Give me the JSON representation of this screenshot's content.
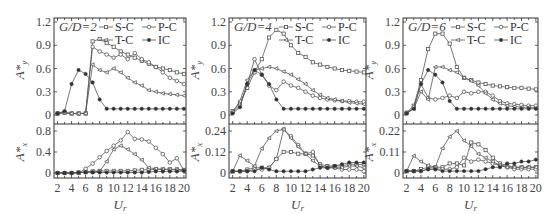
{
  "figure": {
    "panels": [
      {
        "label": "G/D=2",
        "gd_prefix": "G/D",
        "gd_value": "2"
      },
      {
        "label": "G/D=4",
        "gd_prefix": "G/D",
        "gd_value": "4"
      },
      {
        "label": "G/D=6",
        "gd_prefix": "G/D",
        "gd_value": "6"
      }
    ],
    "xlabel": "Ur",
    "legend": [
      "S-C",
      "P-C",
      "T-C",
      "IC"
    ]
  },
  "chart_data": [
    {
      "type": "line",
      "title": "G/D=2 (A*y)",
      "xlabel": "Ur",
      "ylabel": "A*y",
      "x": [
        2,
        3,
        4,
        5,
        6,
        7,
        8,
        9,
        10,
        11,
        12,
        13,
        14,
        15,
        16,
        17,
        18,
        19,
        20
      ],
      "ylim": [
        0,
        1.2
      ],
      "yticks": [
        0,
        0.3,
        0.6,
        0.9,
        1.2
      ],
      "series": [
        {
          "name": "S-C",
          "marker": "square",
          "values": [
            0.02,
            0.03,
            0.02,
            0.02,
            0.02,
            0.95,
            0.98,
            0.93,
            0.88,
            0.82,
            0.78,
            0.74,
            0.7,
            0.66,
            0.62,
            0.6,
            0.58,
            0.55,
            0.53
          ]
        },
        {
          "name": "P-C",
          "marker": "circle",
          "values": [
            0.02,
            0.03,
            0.02,
            0.02,
            0.02,
            0.88,
            0.82,
            0.78,
            0.74,
            0.78,
            0.72,
            0.8,
            0.72,
            0.68,
            0.62,
            0.55,
            0.48,
            0.44,
            0.4
          ]
        },
        {
          "name": "T-C",
          "marker": "triangle",
          "values": [
            0.02,
            0.03,
            0.02,
            0.02,
            0.02,
            0.65,
            0.58,
            0.55,
            0.6,
            0.55,
            0.48,
            0.42,
            0.38,
            0.32,
            0.3,
            0.28,
            0.27,
            0.26,
            0.25
          ]
        },
        {
          "name": "IC",
          "marker": "filled-circle",
          "values": [
            0.02,
            0.05,
            0.4,
            0.58,
            0.53,
            0.42,
            0.2,
            0.08,
            0.08,
            0.08,
            0.08,
            0.08,
            0.08,
            0.08,
            0.08,
            0.08,
            0.08,
            0.08,
            0.08
          ]
        }
      ]
    },
    {
      "type": "line",
      "title": "G/D=2 (A*x)",
      "xlabel": "Ur",
      "ylabel": "A*x",
      "x": [
        2,
        3,
        4,
        5,
        6,
        7,
        8,
        9,
        10,
        11,
        12,
        13,
        14,
        15,
        16,
        17,
        18,
        19,
        20
      ],
      "ylim": [
        0,
        0.8
      ],
      "yticks": [
        0,
        0.4,
        0.8
      ],
      "series": [
        {
          "name": "S-C",
          "marker": "square",
          "values": [
            0,
            0,
            0,
            0.01,
            0.02,
            0.03,
            0.04,
            0.04,
            0.04,
            0.04,
            0.04,
            0.05,
            0.06,
            0.06,
            0.07,
            0.07,
            0.07,
            0.07,
            0.06
          ]
        },
        {
          "name": "P-C",
          "marker": "circle",
          "values": [
            0,
            0,
            0,
            0,
            0.08,
            0.18,
            0.3,
            0.42,
            0.52,
            0.62,
            0.78,
            0.65,
            0.64,
            0.6,
            0.48,
            0.36,
            0.2,
            0.28,
            0.05
          ]
        },
        {
          "name": "T-C",
          "marker": "triangle",
          "values": [
            0,
            0,
            0,
            0,
            0.02,
            0.03,
            0.03,
            0.22,
            0.45,
            0.52,
            0.45,
            0.36,
            0.25,
            0.1,
            0.08,
            0.07,
            0.07,
            0.06,
            0.05
          ]
        },
        {
          "name": "IC",
          "marker": "filled-circle",
          "values": [
            0,
            0,
            0,
            0.01,
            0.01,
            0.01,
            0.01,
            0.01,
            0.01,
            0.01,
            0.01,
            0.01,
            0.01,
            0.02,
            0.03,
            0.03,
            0.03,
            0.03,
            0.04
          ]
        }
      ]
    },
    {
      "type": "line",
      "title": "G/D=4 (A*y)",
      "xlabel": "Ur",
      "ylabel": "A*y",
      "x": [
        2,
        3,
        4,
        5,
        6,
        7,
        8,
        9,
        10,
        11,
        12,
        13,
        14,
        15,
        16,
        17,
        18,
        19,
        20
      ],
      "ylim": [
        0,
        1.2
      ],
      "yticks": [
        0,
        0.3,
        0.6,
        0.9,
        1.2
      ],
      "series": [
        {
          "name": "S-C",
          "marker": "square",
          "values": [
            0.05,
            0.15,
            0.35,
            0.55,
            0.72,
            1.0,
            1.1,
            1.05,
            0.9,
            0.8,
            0.75,
            0.68,
            0.65,
            0.62,
            0.6,
            0.58,
            0.57,
            0.56,
            0.55
          ]
        },
        {
          "name": "P-C",
          "marker": "circle",
          "values": [
            0.03,
            0.12,
            0.4,
            0.72,
            0.52,
            0.38,
            0.32,
            0.43,
            0.38,
            0.35,
            0.3,
            0.25,
            0.22,
            0.2,
            0.19,
            0.18,
            0.18,
            0.17,
            0.17
          ]
        },
        {
          "name": "T-C",
          "marker": "triangle",
          "values": [
            0.04,
            0.18,
            0.45,
            0.58,
            0.6,
            0.62,
            0.6,
            0.56,
            0.52,
            0.46,
            0.4,
            0.32,
            0.26,
            0.22,
            0.2,
            0.18,
            0.16,
            0.15,
            0.14
          ]
        },
        {
          "name": "IC",
          "marker": "filled-circle",
          "values": [
            0.02,
            0.1,
            0.4,
            0.58,
            0.52,
            0.4,
            0.2,
            0.08,
            0.08,
            0.08,
            0.08,
            0.08,
            0.08,
            0.08,
            0.08,
            0.08,
            0.08,
            0.08,
            0.08
          ]
        }
      ]
    },
    {
      "type": "line",
      "title": "G/D=4 (A*x)",
      "xlabel": "Ur",
      "ylabel": "A*x",
      "x": [
        2,
        3,
        4,
        5,
        6,
        7,
        8,
        9,
        10,
        11,
        12,
        13,
        14,
        15,
        16,
        17,
        18,
        19,
        20
      ],
      "ylim": [
        0,
        0.24
      ],
      "yticks": [
        0,
        0.12,
        0.24
      ],
      "series": [
        {
          "name": "S-C",
          "marker": "square",
          "values": [
            0.01,
            0.01,
            0.02,
            0.03,
            0.03,
            0.03,
            0.08,
            0.12,
            0.12,
            0.11,
            0.11,
            0.1,
            0.05,
            0.04,
            0.04,
            0.04,
            0.05,
            0.05,
            0.05
          ]
        },
        {
          "name": "P-C",
          "marker": "circle",
          "values": [
            0.01,
            0.01,
            0.01,
            0.02,
            0.02,
            0.03,
            0.08,
            0.25,
            0.21,
            0.16,
            0.11,
            0.12,
            0.04,
            0.03,
            0.03,
            0.02,
            0.02,
            0.02,
            0.01
          ]
        },
        {
          "name": "T-C",
          "marker": "triangle",
          "values": [
            0.01,
            0.1,
            0.07,
            0.04,
            0.14,
            0.2,
            0.24,
            0.25,
            0.2,
            0.15,
            0.11,
            0.07,
            0.04,
            0.03,
            0.03,
            0.03,
            0.04,
            0.04,
            0.03
          ]
        },
        {
          "name": "IC",
          "marker": "filled-circle",
          "values": [
            0.01,
            0.01,
            0.01,
            0.01,
            0.03,
            0.02,
            0.01,
            0.01,
            0.01,
            0.01,
            0.01,
            0.02,
            0.03,
            0.03,
            0.04,
            0.05,
            0.06,
            0.06,
            0.06
          ]
        }
      ]
    },
    {
      "type": "line",
      "title": "G/D=6 (A*y)",
      "xlabel": "Ur",
      "ylabel": "A*y",
      "x": [
        2,
        3,
        4,
        5,
        6,
        7,
        8,
        9,
        10,
        11,
        12,
        13,
        14,
        15,
        16,
        17,
        18,
        19,
        20
      ],
      "ylim": [
        0,
        1.2
      ],
      "yticks": [
        0,
        0.3,
        0.6,
        0.9,
        1.2
      ],
      "series": [
        {
          "name": "S-C",
          "marker": "square",
          "values": [
            0.03,
            0.12,
            0.45,
            0.85,
            1.05,
            1.05,
            0.92,
            0.62,
            0.48,
            0.45,
            0.42,
            0.4,
            0.38,
            0.37,
            0.36,
            0.35,
            0.35,
            0.34,
            0.33
          ]
        },
        {
          "name": "P-C",
          "marker": "circle",
          "values": [
            0.02,
            0.1,
            0.4,
            0.22,
            0.2,
            0.22,
            0.25,
            0.22,
            0.3,
            0.28,
            0.3,
            0.3,
            0.25,
            0.18,
            0.15,
            0.14,
            0.13,
            0.12,
            0.12
          ]
        },
        {
          "name": "T-C",
          "marker": "triangle",
          "values": [
            0.03,
            0.08,
            0.3,
            0.2,
            0.62,
            0.62,
            0.58,
            0.55,
            0.48,
            0.44,
            0.38,
            0.28,
            0.2,
            0.15,
            0.12,
            0.11,
            0.1,
            0.1,
            0.09
          ]
        },
        {
          "name": "IC",
          "marker": "filled-circle",
          "values": [
            0.02,
            0.08,
            0.4,
            0.58,
            0.52,
            0.42,
            0.18,
            0.08,
            0.08,
            0.08,
            0.08,
            0.08,
            0.08,
            0.08,
            0.08,
            0.08,
            0.08,
            0.08,
            0.08
          ]
        }
      ]
    },
    {
      "type": "line",
      "title": "G/D=6 (A*x)",
      "xlabel": "Ur",
      "ylabel": "A*x",
      "x": [
        2,
        3,
        4,
        5,
        6,
        7,
        8,
        9,
        10,
        11,
        12,
        13,
        14,
        15,
        16,
        17,
        18,
        19,
        20
      ],
      "ylim": [
        0,
        0.22
      ],
      "yticks": [
        0,
        0.11,
        0.22
      ],
      "series": [
        {
          "name": "S-C",
          "marker": "square",
          "values": [
            0.01,
            0.01,
            0.02,
            0.03,
            0.03,
            0.03,
            0.05,
            0.05,
            0.04,
            0.16,
            0.15,
            0.12,
            0.08,
            0.05,
            0.04,
            0.03,
            0.03,
            0.03,
            0.03
          ]
        },
        {
          "name": "P-C",
          "marker": "circle",
          "values": [
            0.01,
            0.01,
            0.01,
            0.02,
            0.02,
            0.02,
            0.02,
            0.03,
            0.08,
            0.06,
            0.07,
            0.06,
            0.05,
            0.04,
            0.03,
            0.02,
            0.02,
            0.02,
            0.02
          ]
        },
        {
          "name": "T-C",
          "marker": "triangle",
          "values": [
            0.01,
            0.09,
            0.06,
            0.04,
            0.03,
            0.13,
            0.19,
            0.22,
            0.17,
            0.14,
            0.1,
            0.08,
            0.06,
            0.04,
            0.03,
            0.03,
            0.03,
            0.03,
            0.03
          ]
        },
        {
          "name": "IC",
          "marker": "filled-circle",
          "values": [
            0.01,
            0.01,
            0.01,
            0.02,
            0.02,
            0.01,
            0.01,
            0.01,
            0.01,
            0.01,
            0.01,
            0.02,
            0.03,
            0.03,
            0.05,
            0.05,
            0.06,
            0.06,
            0.07
          ]
        }
      ]
    }
  ]
}
